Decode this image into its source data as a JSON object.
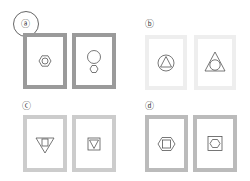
{
  "question": {
    "selected_option": "a",
    "options": [
      {
        "id": "a",
        "label": "ⓐ",
        "border_color": "#9a9a9a",
        "panels": [
          {
            "figure": "hexagon-with-circle"
          },
          {
            "figure": "large-circle-above-small-hexagon"
          }
        ]
      },
      {
        "id": "b",
        "label": "ⓑ",
        "border_color": "#eeeeee",
        "panels": [
          {
            "figure": "triangle-in-circle"
          },
          {
            "figure": "circle-in-triangle"
          }
        ]
      },
      {
        "id": "c",
        "label": "ⓒ",
        "border_color": "#cccccc",
        "panels": [
          {
            "figure": "square-in-inverted-triangle"
          },
          {
            "figure": "inverted-triangle-in-square"
          }
        ]
      },
      {
        "id": "d",
        "label": "ⓓ",
        "border_color": "#bbbbbb",
        "panels": [
          {
            "figure": "square-in-hexagon"
          },
          {
            "figure": "hexagon-in-square"
          }
        ]
      }
    ]
  }
}
